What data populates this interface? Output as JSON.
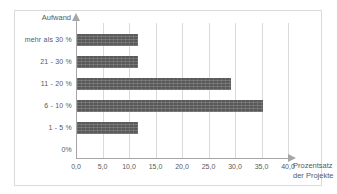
{
  "chart_data": {
    "type": "bar",
    "orientation": "horizontal",
    "title": "",
    "xlabel": "Prozentsatz der Projekte",
    "xlabel_line1": "Prozentsatz",
    "xlabel_line2": "der Projekte",
    "ylabel": "Aufwand",
    "categories": [
      "mehr als 30 %",
      "21 - 30 %",
      "11 - 20 %",
      "6 - 10 %",
      "1 - 5 %",
      "0%"
    ],
    "values": [
      11.5,
      11.5,
      29.0,
      35.0,
      11.5,
      0
    ],
    "xlim": [
      0,
      40
    ],
    "xticks": [
      0,
      5,
      10,
      15,
      20,
      25,
      30,
      35,
      40
    ],
    "xtick_labels": [
      "0,0",
      "5,0",
      "10,0",
      "15,0",
      "20,0",
      "25,0",
      "30,0",
      "35,0",
      "40,0"
    ],
    "grid": "vertical",
    "legend": "none",
    "bar_color": "#595959",
    "grid_color": "#d9d9d9",
    "axis_color": "#a6a6a6",
    "text_color": "#595959"
  }
}
